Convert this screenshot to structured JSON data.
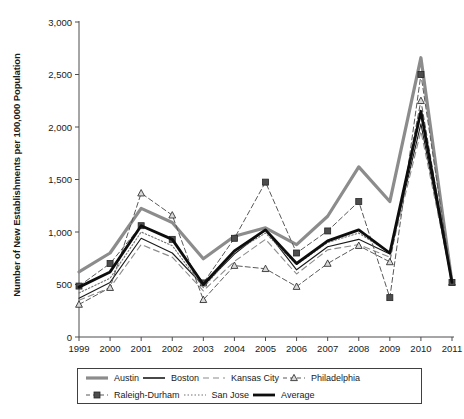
{
  "chart_data": {
    "type": "line",
    "title": "",
    "xlabel": "",
    "ylabel": "Number of New Establishments per 100,000 Population",
    "x": [
      1999,
      2000,
      2001,
      2002,
      2003,
      2004,
      2005,
      2006,
      2007,
      2008,
      2009,
      2010,
      2011
    ],
    "categories": [
      "1999",
      "2000",
      "2001",
      "2002",
      "2003",
      "2004",
      "2005",
      "2006",
      "2007",
      "2008",
      "2009",
      "2010",
      "2011"
    ],
    "ylim": [
      0,
      3000
    ],
    "yticks": [
      0,
      500,
      1000,
      1500,
      2000,
      2500,
      3000
    ],
    "ytick_labels": [
      "0",
      "500",
      "1,000",
      "1,500",
      "2,000",
      "2,500",
      "3,000"
    ],
    "grid": false,
    "legend_position": "bottom",
    "series": [
      {
        "name": "Austin",
        "color": "#8c8c8c",
        "width": 3.2,
        "dash": "none",
        "marker": "none",
        "values": [
          620,
          800,
          1225,
          1090,
          745,
          960,
          1040,
          880,
          1150,
          1620,
          1290,
          2660,
          520
        ]
      },
      {
        "name": "Boston",
        "color": "#1a1a1a",
        "width": 1.1,
        "dash": "none",
        "marker": "none",
        "values": [
          370,
          520,
          940,
          800,
          490,
          790,
          1020,
          640,
          860,
          930,
          790,
          2030,
          520
        ]
      },
      {
        "name": "Kansas City",
        "color": "#8c8c8c",
        "width": 1.1,
        "dash": "6,4",
        "marker": "none",
        "values": [
          350,
          470,
          880,
          760,
          440,
          720,
          930,
          600,
          830,
          880,
          760,
          1960,
          520
        ]
      },
      {
        "name": "Philadelphia",
        "color": "#595959",
        "width": 1.0,
        "dash": "5,3",
        "marker": "triangle",
        "values": [
          310,
          470,
          1370,
          1160,
          355,
          680,
          650,
          480,
          700,
          870,
          715,
          2250,
          520
        ]
      },
      {
        "name": "Raleigh-Durham",
        "color": "#595959",
        "width": 1.0,
        "dash": "5,3",
        "marker": "square",
        "values": [
          485,
          700,
          1060,
          930,
          515,
          940,
          1475,
          800,
          1010,
          1290,
          375,
          2500,
          520
        ]
      },
      {
        "name": "San Jose",
        "color": "#737373",
        "width": 1.1,
        "dash": "1.5,2",
        "marker": "none",
        "values": [
          420,
          560,
          1000,
          870,
          470,
          810,
          990,
          690,
          900,
          990,
          800,
          2120,
          520
        ]
      },
      {
        "name": "Average",
        "color": "#0d0d0d",
        "width": 2.8,
        "dash": "none",
        "marker": "none",
        "values": [
          475,
          620,
          1060,
          930,
          500,
          820,
          1020,
          700,
          915,
          1020,
          800,
          2150,
          520
        ]
      }
    ]
  },
  "legend": {
    "rows": [
      [
        {
          "label": "Austin",
          "key": "line-thick-gray"
        },
        {
          "label": "Boston",
          "key": "line-thin-black"
        },
        {
          "label": "Kansas City",
          "key": "line-dashed-gray"
        },
        {
          "label": "Philadelphia",
          "key": "line-dashed-triangle"
        }
      ],
      [
        {
          "label": "Raleigh-Durham",
          "key": "line-dashed-square"
        },
        {
          "label": "San Jose",
          "key": "line-dotted"
        },
        {
          "label": "Average",
          "key": "line-thick-black"
        }
      ]
    ]
  },
  "axis": {
    "y_title": "Number of New Establishments per 100,000 Population"
  }
}
